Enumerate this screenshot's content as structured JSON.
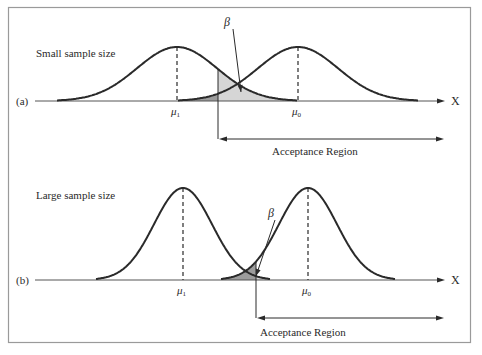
{
  "figure": {
    "frame_color": "#9a9a9a",
    "line_color": "#2a2a2a",
    "fill_dark": "#9c9c9c",
    "fill_light": "#d6d6d6"
  },
  "panels": [
    {
      "id": "a",
      "panel_label": "(a)",
      "title": "Small sample size",
      "axis_label": "X",
      "mu1_label": "μ",
      "mu1_sub": "1",
      "mu0_label": "μ",
      "mu0_sub": "0",
      "beta_label": "β",
      "acceptance_label": "Acceptance Region",
      "geometry": {
        "axis_y": 101,
        "axis_x0": 35,
        "axis_x1": 445,
        "peak_h": 54,
        "mu1_x": 177,
        "mu0_x": 298,
        "sigma": 40,
        "cutoff_x": 218,
        "accept_y": 139,
        "accept_x1": 444,
        "accept_text_x": 272,
        "accept_text_y": 155,
        "title_x": 36,
        "title_y": 57,
        "beta_x": 224,
        "beta_y": 26,
        "beta_arrow": [
          233,
          29,
          241,
          92
        ]
      }
    },
    {
      "id": "b",
      "panel_label": "(b)",
      "title": "Large sample size",
      "axis_label": "X",
      "mu1_label": "μ",
      "mu1_sub": "1",
      "mu0_label": "μ",
      "mu0_sub": "0",
      "beta_label": "β",
      "acceptance_label": "Acceptance Region",
      "geometry": {
        "axis_y": 280,
        "axis_x0": 35,
        "axis_x1": 445,
        "peak_h": 92,
        "mu1_x": 183,
        "mu0_x": 308,
        "sigma": 29,
        "cutoff_x": 256,
        "accept_y": 318,
        "accept_x1": 444,
        "accept_text_x": 260,
        "accept_text_y": 336,
        "title_x": 36,
        "title_y": 199,
        "beta_x": 268,
        "beta_y": 217,
        "beta_arrow": [
          275,
          220,
          256,
          276
        ]
      }
    }
  ]
}
